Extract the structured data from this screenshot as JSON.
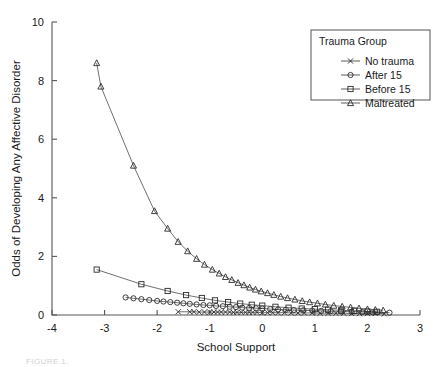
{
  "chart_data": {
    "type": "scatter",
    "title": "",
    "xlabel": "School Support",
    "ylabel": "Odds of Developing Any Affective Disorder",
    "xlim": [
      -4,
      3
    ],
    "ylim": [
      0,
      10
    ],
    "xticks": [
      -4,
      -3,
      -2,
      -1,
      0,
      1,
      2,
      3
    ],
    "yticks": [
      0,
      2,
      4,
      6,
      8,
      10
    ],
    "xtick_labels": [
      "-4",
      "-3",
      "-2",
      "-1",
      "0",
      "1",
      "2",
      "3"
    ],
    "ytick_labels": [
      "0",
      "2",
      "4",
      "6",
      "8",
      "10"
    ],
    "grid": false,
    "legend_position": "top-right",
    "legend_title": "Trauma Group",
    "series": [
      {
        "name": "No trauma",
        "marker": "x",
        "points": [
          [
            -1.6,
            0.11
          ],
          [
            -1.38,
            0.11
          ],
          [
            -1.3,
            0.11
          ],
          [
            -1.2,
            0.1
          ],
          [
            -1.1,
            0.1
          ],
          [
            -1.0,
            0.1
          ],
          [
            -0.92,
            0.1
          ],
          [
            -0.85,
            0.1
          ],
          [
            -0.78,
            0.1
          ],
          [
            -0.7,
            0.1
          ],
          [
            -0.62,
            0.1
          ],
          [
            -0.55,
            0.09
          ],
          [
            -0.48,
            0.09
          ],
          [
            -0.4,
            0.09
          ],
          [
            -0.32,
            0.09
          ],
          [
            -0.25,
            0.09
          ],
          [
            -0.18,
            0.09
          ],
          [
            -0.1,
            0.09
          ],
          [
            0.0,
            0.08
          ],
          [
            0.1,
            0.08
          ],
          [
            0.2,
            0.08
          ],
          [
            0.3,
            0.08
          ],
          [
            0.42,
            0.08
          ],
          [
            0.55,
            0.07
          ],
          [
            0.68,
            0.07
          ],
          [
            0.8,
            0.07
          ],
          [
            0.95,
            0.07
          ],
          [
            1.1,
            0.06
          ],
          [
            1.25,
            0.06
          ],
          [
            1.4,
            0.06
          ],
          [
            1.55,
            0.06
          ],
          [
            1.7,
            0.05
          ],
          [
            1.85,
            0.05
          ],
          [
            2.0,
            0.05
          ],
          [
            2.15,
            0.05
          ],
          [
            2.32,
            0.04
          ]
        ]
      },
      {
        "name": "After 15",
        "marker": "circle",
        "points": [
          [
            -2.6,
            0.6
          ],
          [
            -2.45,
            0.57
          ],
          [
            -2.3,
            0.54
          ],
          [
            -2.15,
            0.51
          ],
          [
            -2.0,
            0.48
          ],
          [
            -1.88,
            0.46
          ],
          [
            -1.75,
            0.44
          ],
          [
            -1.62,
            0.42
          ],
          [
            -1.5,
            0.4
          ],
          [
            -1.38,
            0.38
          ],
          [
            -1.25,
            0.36
          ],
          [
            -1.12,
            0.34
          ],
          [
            -1.0,
            0.33
          ],
          [
            -0.88,
            0.31
          ],
          [
            -0.75,
            0.3
          ],
          [
            -0.62,
            0.28
          ],
          [
            -0.5,
            0.27
          ],
          [
            -0.38,
            0.25
          ],
          [
            -0.25,
            0.24
          ],
          [
            -0.12,
            0.23
          ],
          [
            0.0,
            0.22
          ],
          [
            0.15,
            0.2
          ],
          [
            0.3,
            0.19
          ],
          [
            0.45,
            0.18
          ],
          [
            0.6,
            0.17
          ],
          [
            0.78,
            0.16
          ],
          [
            0.95,
            0.15
          ],
          [
            1.12,
            0.14
          ],
          [
            1.3,
            0.13
          ],
          [
            1.5,
            0.12
          ],
          [
            1.7,
            0.11
          ],
          [
            1.9,
            0.1
          ],
          [
            2.1,
            0.09
          ],
          [
            2.42,
            0.08
          ]
        ]
      },
      {
        "name": "Before 15",
        "marker": "square",
        "points": [
          [
            -3.15,
            1.55
          ],
          [
            -2.3,
            1.05
          ],
          [
            -1.8,
            0.82
          ],
          [
            -1.45,
            0.68
          ],
          [
            -1.15,
            0.58
          ],
          [
            -0.9,
            0.5
          ],
          [
            -0.65,
            0.44
          ],
          [
            -0.42,
            0.39
          ],
          [
            -0.2,
            0.35
          ],
          [
            0.0,
            0.32
          ],
          [
            0.25,
            0.28
          ],
          [
            0.5,
            0.25
          ],
          [
            0.75,
            0.22
          ],
          [
            1.0,
            0.2
          ],
          [
            1.25,
            0.18
          ],
          [
            1.5,
            0.16
          ],
          [
            1.75,
            0.14
          ],
          [
            2.0,
            0.12
          ],
          [
            2.18,
            0.11
          ]
        ]
      },
      {
        "name": "Maltreated",
        "marker": "triangle",
        "points": [
          [
            -3.15,
            8.6
          ],
          [
            -3.07,
            7.8
          ],
          [
            -2.45,
            5.1
          ],
          [
            -2.05,
            3.55
          ],
          [
            -1.8,
            2.95
          ],
          [
            -1.6,
            2.5
          ],
          [
            -1.42,
            2.18
          ],
          [
            -1.25,
            1.92
          ],
          [
            -1.1,
            1.72
          ],
          [
            -0.95,
            1.55
          ],
          [
            -0.82,
            1.42
          ],
          [
            -0.7,
            1.3
          ],
          [
            -0.58,
            1.2
          ],
          [
            -0.46,
            1.1
          ],
          [
            -0.35,
            1.02
          ],
          [
            -0.24,
            0.94
          ],
          [
            -0.13,
            0.87
          ],
          [
            -0.02,
            0.81
          ],
          [
            0.1,
            0.75
          ],
          [
            0.22,
            0.69
          ],
          [
            0.35,
            0.63
          ],
          [
            0.48,
            0.58
          ],
          [
            0.62,
            0.53
          ],
          [
            0.76,
            0.48
          ],
          [
            0.9,
            0.44
          ],
          [
            1.05,
            0.4
          ],
          [
            1.2,
            0.36
          ],
          [
            1.36,
            0.32
          ],
          [
            1.52,
            0.29
          ],
          [
            1.68,
            0.26
          ],
          [
            1.84,
            0.23
          ],
          [
            2.0,
            0.2
          ],
          [
            2.15,
            0.18
          ],
          [
            2.3,
            0.16
          ]
        ]
      }
    ]
  },
  "legend": {
    "title": "Trauma Group",
    "entries": [
      {
        "label": "No trauma",
        "marker": "x"
      },
      {
        "label": "After 15",
        "marker": "circle"
      },
      {
        "label": "Before 15",
        "marker": "square"
      },
      {
        "label": "Maltreated",
        "marker": "triangle"
      }
    ]
  },
  "caption": "FIGURE 1."
}
